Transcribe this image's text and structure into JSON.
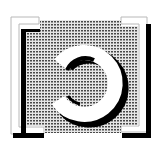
{
  "icon": {
    "label": "Halftone framed ring icon",
    "semantic": "refresh-ring-icon",
    "colors": {
      "background": "#ffffff",
      "halftone_dot": "#555555",
      "halftone_bg": "#e6e6e6",
      "frame_fill": "#ffffff",
      "frame_outline": "#b8b8b8",
      "shadow": "#000000",
      "ring": "#ffffff"
    }
  }
}
